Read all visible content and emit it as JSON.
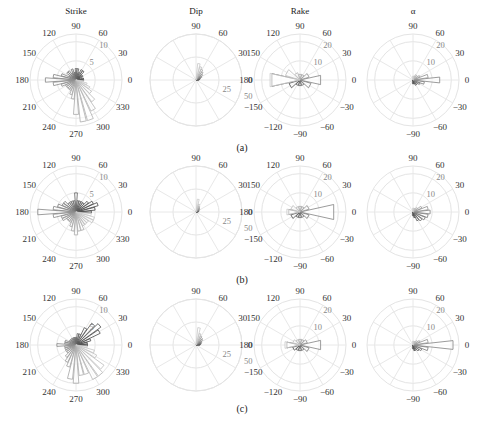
{
  "chart_data": {
    "type": "polar-histogram",
    "columns": [
      {
        "key": "strike",
        "title": "Strike",
        "angle_ticks": [
          0,
          30,
          60,
          90,
          120,
          150,
          180,
          210,
          240,
          270,
          300,
          330
        ],
        "radial_ticks": [
          5,
          10
        ],
        "rmax": 12
      },
      {
        "key": "dip",
        "title": "Dip",
        "angle_ticks": [
          0,
          30,
          60,
          90
        ],
        "radial_ticks": [
          25,
          50
        ],
        "rmax": 50
      },
      {
        "key": "rake",
        "title": "Rake",
        "angle_ticks": [
          0,
          30,
          60,
          90,
          120,
          150,
          180,
          -150,
          -120,
          -90,
          -60,
          -30
        ],
        "radial_ticks": [
          10,
          20
        ],
        "rmax": 24
      },
      {
        "key": "alpha",
        "title": "α",
        "angle_ticks": [
          0,
          30,
          60,
          90,
          -90,
          -60,
          -30
        ],
        "radial_ticks": [
          10,
          20
        ],
        "rmax": 24
      }
    ],
    "rows": [
      {
        "caption": "(a)",
        "strike": {
          "bins_deg": [
            0,
            10,
            20,
            30,
            40,
            50,
            60,
            70,
            80,
            90,
            100,
            110,
            120,
            130,
            140,
            150,
            160,
            170,
            180,
            190,
            200,
            210,
            220,
            230,
            240,
            250,
            260,
            270,
            280,
            290,
            300,
            310,
            320,
            330,
            340,
            350
          ],
          "values": [
            2,
            2,
            1,
            2,
            2,
            3,
            3,
            2,
            3,
            3,
            2,
            3,
            2,
            3,
            3,
            2,
            4,
            6,
            8,
            6,
            4,
            3,
            3,
            3,
            3,
            4,
            5,
            9,
            11,
            11,
            9,
            7,
            5,
            4,
            3,
            2
          ]
        },
        "dip": {
          "bins_deg": [
            0,
            10,
            20,
            30,
            40,
            50,
            60,
            70,
            80
          ],
          "values": [
            3,
            4,
            5,
            7,
            9,
            11,
            13,
            15,
            18
          ]
        },
        "rake": {
          "bins_deg": [
            -180,
            -150,
            -120,
            -90,
            -60,
            -30,
            0,
            30,
            60,
            90,
            120,
            150,
            180
          ],
          "values": [
            15,
            6,
            3,
            3,
            3,
            6,
            11,
            5,
            3,
            3,
            4,
            8,
            16
          ]
        },
        "alpha": {
          "bins_deg": [
            -90,
            -75,
            -60,
            -45,
            -30,
            -15,
            0,
            15,
            30,
            45,
            60,
            75,
            90
          ],
          "values": [
            2,
            2,
            3,
            3,
            4,
            6,
            14,
            8,
            4,
            3,
            3,
            2,
            2
          ]
        }
      },
      {
        "caption": "(b)",
        "strike": {
          "bins_deg": [
            0,
            10,
            20,
            30,
            40,
            50,
            60,
            70,
            80,
            90,
            100,
            110,
            120,
            130,
            140,
            150,
            160,
            170,
            180,
            190,
            200,
            210,
            220,
            230,
            240,
            250,
            260,
            270,
            280,
            290,
            300,
            310,
            320,
            330,
            340,
            350
          ],
          "values": [
            4,
            5,
            6,
            5,
            4,
            3,
            3,
            3,
            3,
            5,
            3,
            3,
            3,
            3,
            4,
            4,
            5,
            6,
            10,
            6,
            4,
            4,
            3,
            3,
            3,
            4,
            5,
            6,
            5,
            5,
            4,
            4,
            4,
            5,
            5,
            4
          ],
          "note": "values are approximate"
        },
        "dip": {
          "bins_deg": [
            0,
            10,
            20,
            30,
            40,
            50,
            60,
            70,
            80
          ],
          "values": [
            2,
            3,
            3,
            4,
            5,
            6,
            7,
            9,
            14
          ]
        },
        "rake": {
          "bins_deg": [
            -180,
            -150,
            -120,
            -90,
            -60,
            -30,
            0,
            30,
            60,
            90,
            120,
            150,
            180
          ],
          "values": [
            6,
            5,
            3,
            3,
            3,
            5,
            18,
            5,
            3,
            3,
            3,
            5,
            7
          ]
        },
        "alpha": {
          "bins_deg": [
            -90,
            -75,
            -60,
            -45,
            -30,
            -15,
            0,
            15,
            30,
            45,
            60,
            75,
            90
          ],
          "values": [
            2,
            3,
            5,
            6,
            7,
            8,
            9,
            8,
            5,
            3,
            2,
            2,
            2
          ]
        }
      },
      {
        "caption": "(c)",
        "strike": {
          "bins_deg": [
            0,
            10,
            20,
            30,
            40,
            50,
            60,
            70,
            80,
            90,
            100,
            110,
            120,
            130,
            140,
            150,
            160,
            170,
            180,
            190,
            200,
            210,
            220,
            230,
            240,
            250,
            260,
            270,
            280,
            290,
            300,
            310,
            320,
            330,
            340,
            350
          ],
          "values": [
            3,
            3,
            4,
            7,
            8,
            7,
            5,
            3,
            3,
            2,
            2,
            2,
            2,
            2,
            2,
            2,
            3,
            3,
            5,
            3,
            3,
            3,
            3,
            4,
            5,
            6,
            9,
            10,
            8,
            8,
            10,
            10,
            9,
            6,
            5,
            3
          ]
        },
        "dip": {
          "bins_deg": [
            0,
            10,
            20,
            30,
            40,
            50,
            60,
            70,
            80
          ],
          "values": [
            4,
            5,
            6,
            7,
            9,
            10,
            11,
            13,
            19
          ]
        },
        "rake": {
          "bins_deg": [
            -180,
            -150,
            -120,
            -90,
            -60,
            -30,
            0,
            30,
            60,
            90,
            120,
            150,
            180
          ],
          "values": [
            7,
            4,
            3,
            3,
            3,
            5,
            11,
            4,
            3,
            3,
            3,
            4,
            8
          ]
        },
        "alpha": {
          "bins_deg": [
            -90,
            -75,
            -60,
            -45,
            -30,
            -15,
            0,
            15,
            30,
            45,
            60,
            75,
            90
          ],
          "values": [
            2,
            3,
            3,
            4,
            5,
            8,
            21,
            8,
            4,
            3,
            2,
            2,
            2
          ]
        }
      }
    ]
  }
}
